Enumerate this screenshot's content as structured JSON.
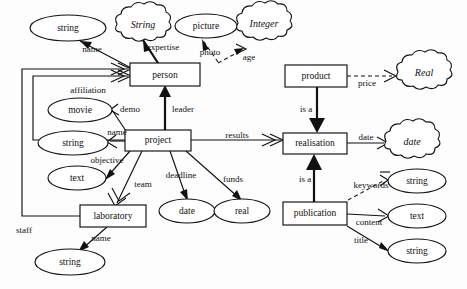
{
  "diagram": {
    "entities": [
      {
        "id": "person",
        "label": "person",
        "x": 130,
        "y": 63,
        "w": 70,
        "h": 23
      },
      {
        "id": "project",
        "label": "project",
        "x": 125,
        "y": 130,
        "w": 66,
        "h": 21
      },
      {
        "id": "laboratory",
        "label": "laboratory",
        "x": 80,
        "y": 205,
        "w": 66,
        "h": 22
      },
      {
        "id": "product",
        "label": "product",
        "x": 285,
        "y": 65,
        "w": 62,
        "h": 22
      },
      {
        "id": "realisation",
        "label": "realisation",
        "x": 283,
        "y": 133,
        "w": 64,
        "h": 21
      },
      {
        "id": "publication",
        "label": "publication",
        "x": 283,
        "y": 202,
        "w": 64,
        "h": 23
      }
    ],
    "attributes": [
      {
        "id": "string-name-person",
        "label": "string",
        "cx": 68,
        "cy": 28,
        "rx": 38,
        "ry": 13
      },
      {
        "id": "picture-photo",
        "label": "picture",
        "cx": 206,
        "cy": 26,
        "rx": 31,
        "ry": 12
      },
      {
        "id": "movie-demo",
        "label": "movie",
        "cx": 80,
        "cy": 110,
        "rx": 32,
        "ry": 12
      },
      {
        "id": "string-name-project",
        "label": "string",
        "cx": 73,
        "cy": 143,
        "rx": 35,
        "ry": 12
      },
      {
        "id": "text-objective",
        "label": "text",
        "cx": 77,
        "cy": 178,
        "rx": 29,
        "ry": 12
      },
      {
        "id": "string-name-lab",
        "label": "string",
        "cx": 70,
        "cy": 262,
        "rx": 35,
        "ry": 13
      },
      {
        "id": "date-deadline",
        "label": "date",
        "cx": 187,
        "cy": 211,
        "rx": 28,
        "ry": 12
      },
      {
        "id": "real-funds",
        "label": "real",
        "cx": 242,
        "cy": 211,
        "rx": 28,
        "ry": 12
      },
      {
        "id": "string-keywords",
        "label": "string",
        "cx": 417,
        "cy": 181,
        "rx": 29,
        "ry": 12
      },
      {
        "id": "text-content",
        "label": "text",
        "cx": 417,
        "cy": 216,
        "rx": 29,
        "ry": 12
      },
      {
        "id": "string-title",
        "label": "string",
        "cx": 417,
        "cy": 251,
        "rx": 29,
        "ry": 12
      }
    ],
    "type_clouds": [
      {
        "id": "cloud-string",
        "label": "String",
        "cx": 143,
        "cy": 26,
        "rx": 30,
        "ry": 14
      },
      {
        "id": "cloud-integer",
        "label": "Integer",
        "cx": 263,
        "cy": 25,
        "rx": 29,
        "ry": 14
      },
      {
        "id": "cloud-real",
        "label": "Real",
        "cx": 425,
        "cy": 74,
        "rx": 31,
        "ry": 14
      },
      {
        "id": "cloud-date",
        "label": "date",
        "cx": 412,
        "cy": 143,
        "rx": 30,
        "ry": 14
      }
    ],
    "edge_labels": [
      {
        "id": "label-name-person",
        "text": "name",
        "x": 92,
        "y": 50
      },
      {
        "id": "label-expertise",
        "text": "expertise",
        "x": 162,
        "y": 48
      },
      {
        "id": "label-photo",
        "text": "photo",
        "x": 208,
        "y": 53
      },
      {
        "id": "label-age",
        "text": "age",
        "x": 250,
        "y": 57
      },
      {
        "id": "label-price",
        "text": "price",
        "x": 368,
        "y": 83
      },
      {
        "id": "label-affiliation",
        "text": "affiliation",
        "x": 88,
        "y": 91
      },
      {
        "id": "label-demo",
        "text": "demo",
        "x": 128,
        "y": 110
      },
      {
        "id": "label-leader",
        "text": "leader",
        "x": 182,
        "y": 110
      },
      {
        "id": "label-name-project",
        "text": "name",
        "x": 116,
        "y": 133
      },
      {
        "id": "label-results",
        "text": "results",
        "x": 238,
        "y": 136
      },
      {
        "id": "label-date-real",
        "text": "date",
        "x": 366,
        "y": 138
      },
      {
        "id": "label-objective",
        "text": "objective",
        "x": 107,
        "y": 161
      },
      {
        "id": "label-team",
        "text": "team",
        "x": 142,
        "y": 184
      },
      {
        "id": "label-deadline",
        "text": "deadline",
        "x": 180,
        "y": 176
      },
      {
        "id": "label-funds",
        "text": "funds",
        "x": 232,
        "y": 180
      },
      {
        "id": "label-is-a-product",
        "text": "is a",
        "x": 307,
        "y": 110
      },
      {
        "id": "label-is-a-pub",
        "text": "is a",
        "x": 307,
        "y": 180
      },
      {
        "id": "label-keywords",
        "text": "keywords",
        "x": 372,
        "y": 185
      },
      {
        "id": "label-content",
        "text": "content",
        "x": 368,
        "y": 222
      },
      {
        "id": "label-title",
        "text": "title",
        "x": 360,
        "y": 241
      },
      {
        "id": "label-staff",
        "text": "staff",
        "x": 24,
        "y": 231
      },
      {
        "id": "label-name-lab",
        "text": "name",
        "x": 100,
        "y": 239
      }
    ],
    "colors": {
      "stroke": "#111111",
      "fill": "#ffffff",
      "background": "#fdfdfd"
    }
  }
}
